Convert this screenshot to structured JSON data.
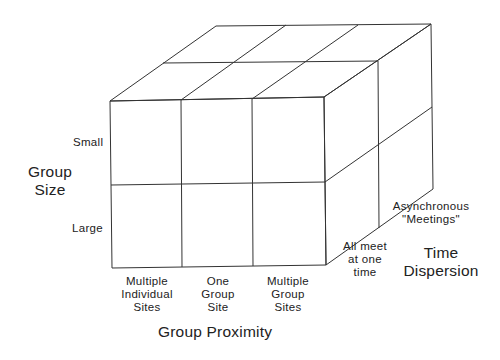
{
  "diagram": {
    "stroke_color": "#333333",
    "axes": {
      "group_size": {
        "title_line1": "Group",
        "title_line2": "Size",
        "levels": [
          "Small",
          "Large"
        ]
      },
      "group_proximity": {
        "title": "Group Proximity",
        "levels": [
          {
            "line1": "Multiple",
            "line2": "Individual",
            "line3": "Sites"
          },
          {
            "line1": "One",
            "line2": "Group",
            "line3": "Site"
          },
          {
            "line1": "Multiple",
            "line2": "Group",
            "line3": "Sites"
          }
        ]
      },
      "time_dispersion": {
        "title_line1": "Time",
        "title_line2": "Dispersion",
        "levels": [
          {
            "line1": "All meet",
            "line2": "at one",
            "line3": "time"
          },
          {
            "line1": "Asynchronous",
            "line2": "\"Meetings\""
          }
        ]
      }
    }
  }
}
